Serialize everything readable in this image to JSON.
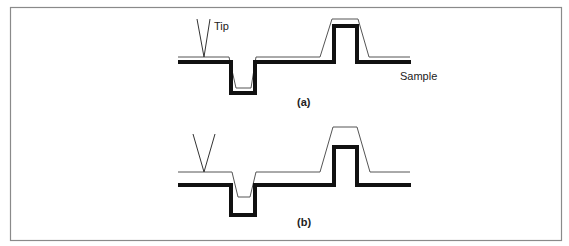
{
  "figure": {
    "panels": [
      {
        "id": "a",
        "caption": "(a)",
        "labels": {
          "tip": "Tip",
          "sample": "Sample"
        },
        "description": "Sharp tip: measured profile closely follows the sample surface"
      },
      {
        "id": "b",
        "caption": "(b)",
        "labels": {},
        "description": "Blunt tip: measured profile broadened and shallower than the sample surface"
      }
    ],
    "legend": {
      "thin_line": "measured tip trace",
      "thick_line": "sample surface"
    },
    "colors": {
      "frame": "#8a8a8a",
      "sample": "#111111",
      "trace": "#555555"
    }
  }
}
